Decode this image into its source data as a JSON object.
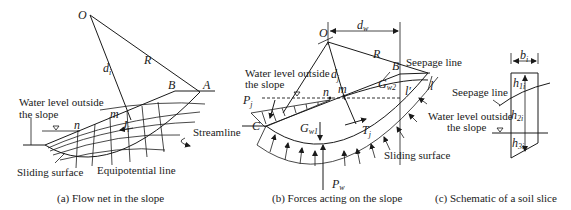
{
  "panel_a": {
    "caption": "(a) Flow net in the slope",
    "labels": {
      "O": "O",
      "R": "R",
      "d": "d",
      "d_sub": "i",
      "A": "A",
      "B": "B",
      "m": "m",
      "n": "n",
      "J": "J",
      "J_sub": "i",
      "water_level_1": "Water level outside",
      "water_level_2": "the slope",
      "streamline": "Streamline",
      "sliding_surface": "Sliding surface",
      "equipotential": "Equipotential line"
    }
  },
  "panel_b": {
    "caption": "(b) Forces acting on the slope",
    "labels": {
      "O": "O",
      "d_w": "d",
      "d_w_sub": "w",
      "R": "R",
      "B": "B",
      "seepage_line": "Seepage line",
      "water_level_1": "Water level outside",
      "water_level_2": "the slope",
      "d_j": "d",
      "d_j_sub": "j",
      "P": "P",
      "P_sub": "j",
      "n": "n",
      "m": "m",
      "G_w2": "G",
      "G_w2_sub": "w2",
      "l_prime": "l′",
      "l": "l",
      "T": "T",
      "T_sub": "j",
      "C": "C",
      "G_w1": "G",
      "G_w1_sub": "w1",
      "sliding_surface": "Sliding surface",
      "P_w": "P",
      "P_w_sub": "w"
    }
  },
  "panel_c": {
    "caption": "(c) Schematic of a soil slice",
    "labels": {
      "b": "b",
      "b_sub": "i",
      "h1": "h",
      "h1_sub": "1i",
      "h2": "h",
      "h2_sub": "2i",
      "h3": "h",
      "h3_sub": "3i",
      "seepage_line": "Seepage line",
      "water_level_1": "Water level outside",
      "water_level_2": "the slope"
    }
  }
}
